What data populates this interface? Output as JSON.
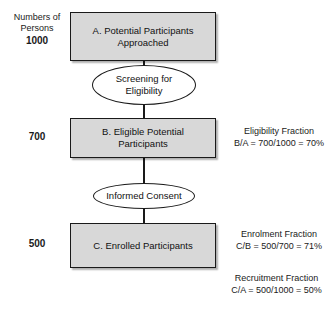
{
  "diagram": {
    "left_axis": {
      "header_line1": "Numbers of",
      "header_line2": "Persons",
      "counts": [
        "1000",
        "700",
        "500"
      ]
    },
    "nodes": [
      {
        "id": "A",
        "shape": "box",
        "label": "A. Potential Participants\nApproached",
        "fill": "#d8d8d8",
        "border": "#1a1a1a"
      },
      {
        "id": "screening",
        "shape": "ellipse",
        "label": "Screening for\nEligibility",
        "fill": "#ffffff",
        "border": "#1a1a1a"
      },
      {
        "id": "B",
        "shape": "box",
        "label": "B. Eligible Potential\nParticipants",
        "fill": "#d8d8d8",
        "border": "#1a1a1a"
      },
      {
        "id": "consent",
        "shape": "ellipse",
        "label": "Informed Consent",
        "fill": "#ffffff",
        "border": "#1a1a1a"
      },
      {
        "id": "C",
        "shape": "box",
        "label": "C. Enrolled Participants",
        "fill": "#d8d8d8",
        "border": "#1a1a1a"
      }
    ],
    "annotations": [
      {
        "name": "eligibility-fraction",
        "title": "Eligibility Fraction",
        "formula": "B/A = 700/1000 = 70%"
      },
      {
        "name": "enrolment-fraction",
        "title": "Enrolment Fraction",
        "formula": "C/B = 500/700 = 71%"
      },
      {
        "name": "recruitment-fraction",
        "title": "Recruitment Fraction",
        "formula": "C/A = 500/1000 = 50%"
      }
    ]
  }
}
